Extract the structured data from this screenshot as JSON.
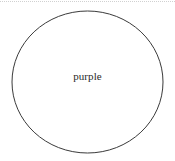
{
  "figure": {
    "kind": "set-diagram",
    "background_color": "#ffffff",
    "width": 175,
    "height": 161
  },
  "top_rule": {
    "name": "page-edge-dotted-rule",
    "color": "#c9c9c9",
    "style": "dotted"
  },
  "circle": {
    "label": "purple",
    "stroke_color": "#3a3a3a",
    "fill": "none",
    "stroke_width": 1,
    "center_x": 87.5,
    "center_y": 82,
    "radius_x": 75.5,
    "radius_y": 71
  },
  "label": {
    "text": "purple",
    "color": "#2a2a2a"
  }
}
